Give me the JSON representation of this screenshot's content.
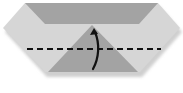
{
  "diagram": {
    "type": "origami-fold-step",
    "instruction_text": "",
    "colors": {
      "paper_light": "#d6d6d6",
      "paper_dark": "#a3a3a3",
      "shadow": "#c8c8c8",
      "fold_line": "#111111",
      "arrow": "#111111",
      "background": "#ffffff"
    },
    "elements": {
      "outer_shape": "hexagon",
      "top_flap": "trapezoid",
      "center_flap": "triangle",
      "fold_line": "valley-fold-dashed",
      "arrow": "fold-up-arrow"
    }
  }
}
